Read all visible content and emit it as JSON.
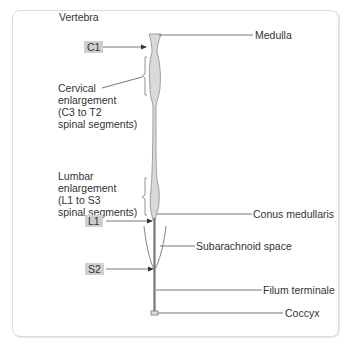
{
  "diagram": {
    "title_label": "Vertebra",
    "vertebra_badges": [
      {
        "id": "c1",
        "text": "C1"
      },
      {
        "id": "l1",
        "text": "L1"
      },
      {
        "id": "s2",
        "text": "S2"
      }
    ],
    "left_labels": {
      "cervical": [
        "Cervical",
        "enlargement",
        "(C3 to T2",
        "spinal segments)"
      ],
      "lumbar": [
        "Lumbar",
        "enlargement",
        "(L1 to S3",
        "spinal segments)"
      ]
    },
    "right_labels": {
      "medulla": "Medulla",
      "conus": "Conus medullaris",
      "subarachnoid": "Subarachnoid space",
      "filum": "Filum terminale",
      "coccyx": "Coccyx"
    },
    "colors": {
      "cord_fill": "#d9d9d9",
      "cord_stroke": "#8a8a8a",
      "line": "#555555",
      "badge_bg": "#cfcfcf",
      "panel_border": "#dcdcdc"
    }
  }
}
